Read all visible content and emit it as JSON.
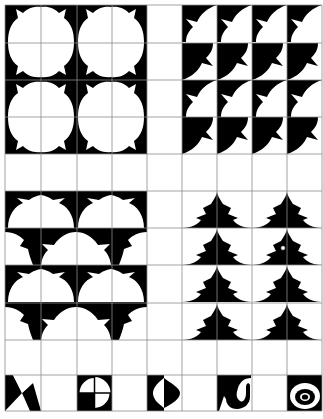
{
  "colors": {
    "ink": "#000000",
    "paper": "#ffffff",
    "grid": "#8c8c8c"
  },
  "grid": {
    "cols_x": [
      5,
      41,
      77,
      112,
      147,
      182,
      217,
      252,
      287,
      322
    ],
    "rows_y": [
      5,
      43,
      80,
      117,
      154,
      191,
      228,
      265,
      303,
      340,
      375,
      411
    ]
  },
  "panels": [
    {
      "id": "quatrefoil-tiles",
      "label": "Four-lobed flower tiling",
      "position": "top-left"
    },
    {
      "id": "diagonal-leaf-tiles",
      "label": "Diagonal leaf tiling",
      "position": "top-right"
    },
    {
      "id": "scallop-tiles",
      "label": "Scalloped half-flower tiling",
      "position": "middle-left"
    },
    {
      "id": "spire-tiles",
      "label": "Spire / pagoda tiling",
      "position": "middle-right"
    }
  ],
  "motifs": [
    {
      "id": "motif-bowtie",
      "label": "Bow-tie triangles"
    },
    {
      "id": "motif-quartered-circle",
      "label": "Quartered circle"
    },
    {
      "id": "motif-half-lens",
      "label": "Half lens"
    },
    {
      "id": "motif-hook",
      "label": "Hook curl"
    },
    {
      "id": "motif-eye",
      "label": "Concentric eye"
    }
  ]
}
